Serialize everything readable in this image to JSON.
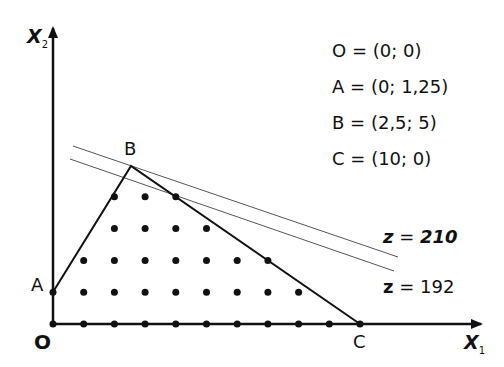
{
  "axes": {
    "x_label": "X",
    "x_sub": "1",
    "y_label": "X",
    "y_sub": "2"
  },
  "points": {
    "O": "O",
    "A": "A",
    "B": "B",
    "C": "C"
  },
  "legend": [
    {
      "name": "O",
      "eq": "=",
      "value": "(0; 0)"
    },
    {
      "name": "A",
      "eq": "=",
      "value": "(0; 1,25)"
    },
    {
      "name": "B",
      "eq": "=",
      "value": "(2,5; 5)"
    },
    {
      "name": "C",
      "eq": "=",
      "value": "(10; 0)"
    }
  ],
  "objective_lines": [
    {
      "label_var": "z",
      "label_eq": "=",
      "label_val": "210",
      "italic": true
    },
    {
      "label_var": "z",
      "label_eq": "=",
      "label_val": "192",
      "italic": false
    }
  ],
  "chart_data": {
    "type": "scatter",
    "xlabel": "X1",
    "ylabel": "X2",
    "vertices": {
      "O": [
        0,
        0
      ],
      "A": [
        0,
        1.25
      ],
      "B": [
        2.5,
        5
      ],
      "C": [
        10,
        0
      ]
    },
    "lattice_points": [
      [
        0,
        0
      ],
      [
        1,
        0
      ],
      [
        2,
        0
      ],
      [
        3,
        0
      ],
      [
        4,
        0
      ],
      [
        5,
        0
      ],
      [
        6,
        0
      ],
      [
        7,
        0
      ],
      [
        8,
        0
      ],
      [
        9,
        0
      ],
      [
        10,
        0
      ],
      [
        0,
        1
      ],
      [
        1,
        1
      ],
      [
        2,
        1
      ],
      [
        3,
        1
      ],
      [
        4,
        1
      ],
      [
        5,
        1
      ],
      [
        6,
        1
      ],
      [
        7,
        1
      ],
      [
        8,
        1
      ],
      [
        1,
        2
      ],
      [
        2,
        2
      ],
      [
        3,
        2
      ],
      [
        4,
        2
      ],
      [
        5,
        2
      ],
      [
        6,
        2
      ],
      [
        7,
        2
      ],
      [
        2,
        3
      ],
      [
        3,
        3
      ],
      [
        4,
        3
      ],
      [
        5,
        3
      ],
      [
        2,
        4
      ],
      [
        3,
        4
      ],
      [
        4,
        4
      ]
    ],
    "objective_levels": [
      210,
      192
    ]
  }
}
